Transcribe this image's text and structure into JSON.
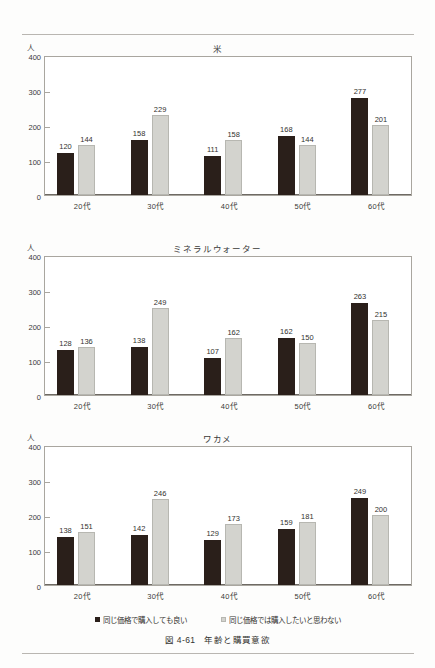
{
  "figure": {
    "caption_number": "図 4-61",
    "caption_title": "年齢と購買意欲",
    "unit_label": "人",
    "categories": [
      "20代",
      "30代",
      "40代",
      "50代",
      "60代"
    ],
    "y_ticks": [
      "400",
      "300",
      "200",
      "100",
      "0"
    ],
    "colors": {
      "series_dark": "#2a1f1a",
      "series_light": "#d3d3ce",
      "frame": "#a9a69f",
      "text": "#33322f"
    }
  },
  "legend": {
    "items": [
      {
        "marker": "square-dark-icon",
        "label": "同じ価格で購入しても良い"
      },
      {
        "marker": "square-light-icon",
        "label": "同じ価格では購入したいと思わない"
      }
    ]
  },
  "chart_data": [
    {
      "type": "bar",
      "title": "米",
      "xlabel": "",
      "ylabel": "人",
      "ylim": [
        0,
        400
      ],
      "yticks": [
        0,
        100,
        200,
        300,
        400
      ],
      "grid": false,
      "legend_position": "bottom-shared",
      "categories": [
        "20代",
        "30代",
        "40代",
        "50代",
        "60代"
      ],
      "series": [
        {
          "name": "同じ価格で購入しても良い",
          "values": [
            120,
            158,
            111,
            168,
            277
          ]
        },
        {
          "name": "同じ価格では購入したいと思わない",
          "values": [
            144,
            229,
            158,
            144,
            201
          ]
        }
      ]
    },
    {
      "type": "bar",
      "title": "ミネラルウォーター",
      "xlabel": "",
      "ylabel": "人",
      "ylim": [
        0,
        400
      ],
      "yticks": [
        0,
        100,
        200,
        300,
        400
      ],
      "grid": false,
      "legend_position": "bottom-shared",
      "categories": [
        "20代",
        "30代",
        "40代",
        "50代",
        "60代"
      ],
      "series": [
        {
          "name": "同じ価格で購入しても良い",
          "values": [
            128,
            138,
            107,
            162,
            263
          ]
        },
        {
          "name": "同じ価格では購入したいと思わない",
          "values": [
            136,
            249,
            162,
            150,
            215
          ]
        }
      ]
    },
    {
      "type": "bar",
      "title": "ワカメ",
      "xlabel": "",
      "ylabel": "人",
      "ylim": [
        0,
        400
      ],
      "yticks": [
        0,
        100,
        200,
        300,
        400
      ],
      "grid": false,
      "legend_position": "bottom-shared",
      "categories": [
        "20代",
        "30代",
        "40代",
        "50代",
        "60代"
      ],
      "series": [
        {
          "name": "同じ価格で購入しても良い",
          "values": [
            138,
            142,
            129,
            159,
            249
          ]
        },
        {
          "name": "同じ価格では購入したいと思わない",
          "values": [
            151,
            246,
            173,
            181,
            200
          ]
        }
      ]
    }
  ]
}
